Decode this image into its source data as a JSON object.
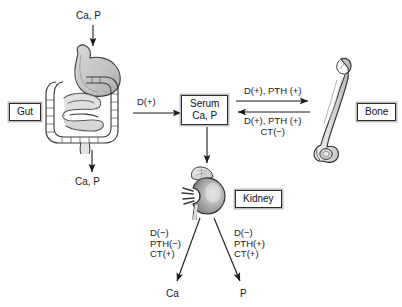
{
  "diagram": {
    "background": "#ffffff",
    "ink": "#1a1a1a"
  },
  "labels": {
    "intake": "Ca, P",
    "fecal_loss": "Ca, P",
    "gut": "Gut",
    "serum_line1": "Serum",
    "serum_line2": "Ca, P",
    "bone": "Bone",
    "kidney": "Kidney",
    "urine_ca": "Ca",
    "urine_p": "P"
  },
  "arrow_annotations": {
    "gut_to_serum": "D(+)",
    "serum_to_bone": "D(+), PTH (+)",
    "bone_to_serum_line1": "D(+), PTH (+)",
    "bone_to_serum_line2": "CT(−)",
    "kidney_ca_line1": "D(−)",
    "kidney_ca_line2": "PTH(−)",
    "kidney_ca_line3": "CT(+)",
    "kidney_p_line1": "D(−)",
    "kidney_p_line2": "PTH(+)",
    "kidney_p_line3": "CT(+)"
  },
  "illustrations": {
    "gut": "gastrointestinal-tract-illustration",
    "bone": "femur-bone-illustration",
    "kidney": "kidney-adrenal-illustration"
  }
}
